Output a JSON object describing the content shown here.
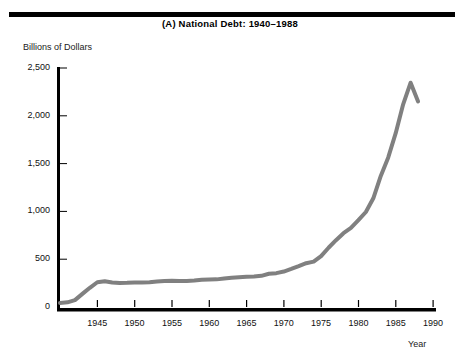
{
  "figure": {
    "title": "(A)  National Debt:  1940–1988",
    "y_axis_label": "Billions of Dollars",
    "x_axis_label": "Year"
  },
  "chart_data": {
    "type": "line",
    "title": "(A)  National Debt:  1940–1988",
    "xlabel": "Year",
    "ylabel": "Billions of Dollars",
    "xlim": [
      1940,
      1990
    ],
    "ylim": [
      0,
      2500
    ],
    "grid": false,
    "legend": null,
    "line_color": "#808080",
    "line_width_px": 4,
    "xticks": [
      1945,
      1950,
      1955,
      1960,
      1965,
      1970,
      1975,
      1980,
      1985,
      1990
    ],
    "xtick_labels": [
      "1945",
      "1950",
      "1955",
      "1960",
      "1965",
      "1970",
      "1975",
      "1980",
      "1985",
      "1990"
    ],
    "yticks": [
      0,
      500,
      1000,
      1500,
      2000,
      2500
    ],
    "ytick_labels": [
      "0",
      "500",
      "1,000",
      "1,500",
      "2,000",
      "2,500"
    ],
    "x": [
      1940,
      1941,
      1942,
      1943,
      1944,
      1945,
      1946,
      1947,
      1948,
      1949,
      1950,
      1951,
      1952,
      1953,
      1954,
      1955,
      1956,
      1957,
      1958,
      1959,
      1960,
      1961,
      1962,
      1963,
      1964,
      1965,
      1966,
      1967,
      1968,
      1969,
      1970,
      1971,
      1972,
      1973,
      1974,
      1975,
      1976,
      1977,
      1978,
      1979,
      1980,
      1981,
      1982,
      1983,
      1984,
      1985,
      1986,
      1987,
      1988
    ],
    "values": [
      43,
      49,
      72,
      137,
      201,
      259,
      270,
      257,
      252,
      253,
      257,
      255,
      259,
      266,
      271,
      274,
      273,
      271,
      276,
      285,
      287,
      289,
      298,
      306,
      312,
      317,
      320,
      326,
      348,
      354,
      371,
      398,
      427,
      458,
      475,
      533,
      620,
      699,
      772,
      827,
      908,
      994,
      1137,
      1371,
      1565,
      1818,
      2120,
      2346,
      2150
    ],
    "annotations": []
  }
}
